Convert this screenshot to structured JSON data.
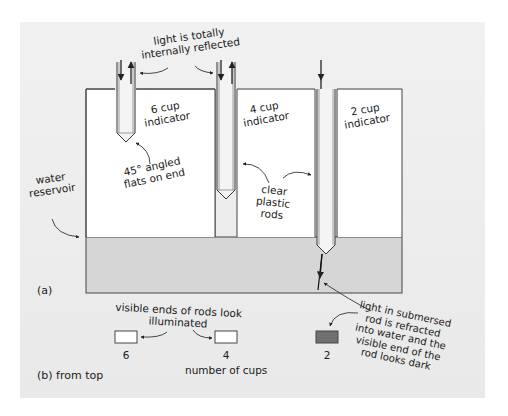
{
  "diagram": {
    "part_a": {
      "label": "(a)",
      "annotations": {
        "tir_line1": "light is totally",
        "tir_line2": "internally reflected",
        "six_cup_line1": "6 cup",
        "six_cup_line2": "indicator",
        "four_cup_line1": "4 cup",
        "four_cup_line2": "indicator",
        "two_cup_line1": "2 cup",
        "two_cup_line2": "indicator",
        "angled_line1": "45° angled",
        "angled_line2": "flats on end",
        "reservoir_line1": "water",
        "reservoir_line2": "reservoir",
        "rods_line1": "clear",
        "rods_line2": "plastic",
        "rods_line3": "rods",
        "refract_line1": "light in submersed",
        "refract_line2": "rod is refracted",
        "refract_line3": "into water and the",
        "refract_line4": "visible end of the",
        "refract_line5": "rod looks dark"
      }
    },
    "part_b": {
      "label": "(b) from top",
      "illuminated_line1": "visible ends of rods look",
      "illuminated_line2": "illuminated",
      "axis_label": "number of cups",
      "indicators": [
        {
          "cups": "6",
          "state": "illuminated",
          "color": "#ffffff"
        },
        {
          "cups": "4",
          "state": "illuminated",
          "color": "#ffffff"
        },
        {
          "cups": "2",
          "state": "dark",
          "color": "#707070"
        }
      ]
    },
    "colors": {
      "background": "#ececec",
      "water": "#d6d6d6",
      "block": "#ffffff",
      "line": "#333333"
    }
  }
}
